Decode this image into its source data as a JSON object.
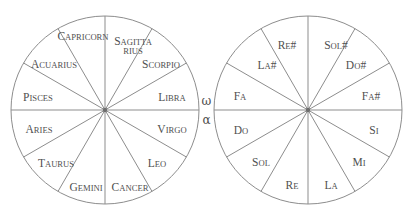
{
  "figure": {
    "background_color": "#ffffff",
    "line_color": "#8d8d8d",
    "text_color": "#4f4f4f",
    "sector_count": 12,
    "sector_degrees": 30
  },
  "connector": {
    "omega": "ω",
    "alpha": "α",
    "omega_name": "omega-symbol",
    "alpha_name": "alpha-symbol"
  },
  "zodiac_wheel": {
    "name": "zodiac-wheel",
    "center_x": 105,
    "center_y": 110,
    "radius": 94,
    "sectors": [
      {
        "id": "sagittarius",
        "line1": "S",
        "line1_rest": "AGITTA",
        "line2": "RIUS",
        "angle": 75,
        "label_x": 133,
        "label_y": 44,
        "two_line": true
      },
      {
        "id": "capricorn",
        "line1": "C",
        "line1_rest": "APRICORN",
        "line2": "",
        "angle": 105,
        "label_x": 83,
        "label_y": 35,
        "two_line": false
      },
      {
        "id": "acuarius",
        "line1": "A",
        "line1_rest": "CUARIUS",
        "line2": "",
        "angle": 135,
        "label_x": 54,
        "label_y": 63,
        "two_line": false
      },
      {
        "id": "pisces",
        "line1": "P",
        "line1_rest": "ISCES",
        "line2": "",
        "angle": 165,
        "label_x": 38,
        "label_y": 96,
        "two_line": false
      },
      {
        "id": "aries",
        "line1": "A",
        "line1_rest": "RIES",
        "line2": "",
        "angle": 195,
        "label_x": 39,
        "label_y": 128,
        "two_line": false
      },
      {
        "id": "taurus",
        "line1": "T",
        "line1_rest": "AURUS",
        "line2": "",
        "angle": 225,
        "label_x": 56,
        "label_y": 162,
        "two_line": false
      },
      {
        "id": "gemini",
        "line1": "G",
        "line1_rest": "EMINI",
        "line2": "",
        "angle": 255,
        "label_x": 86,
        "label_y": 186,
        "two_line": false
      },
      {
        "id": "cancer",
        "line1": "C",
        "line1_rest": "ANCER",
        "line2": "",
        "angle": 285,
        "label_x": 130,
        "label_y": 186,
        "two_line": false
      },
      {
        "id": "leo",
        "line1": "L",
        "line1_rest": "EO",
        "line2": "",
        "angle": 315,
        "label_x": 157,
        "label_y": 162,
        "two_line": false
      },
      {
        "id": "virgo",
        "line1": "V",
        "line1_rest": "IRGO",
        "line2": "",
        "angle": 345,
        "label_x": 172,
        "label_y": 128,
        "two_line": false
      },
      {
        "id": "libra",
        "line1": "L",
        "line1_rest": "IBRA",
        "line2": "",
        "angle": 15,
        "label_x": 172,
        "label_y": 96,
        "two_line": false
      },
      {
        "id": "scorpio",
        "line1": "S",
        "line1_rest": "CORPIO",
        "line2": "",
        "angle": 45,
        "label_x": 161,
        "label_y": 63,
        "two_line": false
      }
    ]
  },
  "solfege_wheel": {
    "name": "solfege-wheel",
    "center_x": 308,
    "center_y": 110,
    "radius": 94,
    "sectors": [
      {
        "id": "sol-sharp",
        "line1": "S",
        "line1_rest": "OL",
        "sharp": "#",
        "angle": 75,
        "label_x": 336,
        "label_y": 44
      },
      {
        "id": "re-sharp",
        "line1": "R",
        "line1_rest": "E",
        "sharp": "#",
        "angle": 105,
        "label_x": 287,
        "label_y": 44
      },
      {
        "id": "la-sharp",
        "line1": "L",
        "line1_rest": "A",
        "sharp": "#",
        "angle": 135,
        "label_x": 267,
        "label_y": 64
      },
      {
        "id": "fa",
        "line1": "F",
        "line1_rest": "A",
        "sharp": "",
        "angle": 165,
        "label_x": 240,
        "label_y": 95
      },
      {
        "id": "do",
        "line1": "D",
        "line1_rest": "O",
        "sharp": "",
        "angle": 195,
        "label_x": 241,
        "label_y": 129
      },
      {
        "id": "sol",
        "line1": "S",
        "line1_rest": "OL",
        "sharp": "",
        "angle": 225,
        "label_x": 261,
        "label_y": 161
      },
      {
        "id": "re",
        "line1": "R",
        "line1_rest": "E",
        "sharp": "",
        "angle": 255,
        "label_x": 292,
        "label_y": 184
      },
      {
        "id": "la",
        "line1": "L",
        "line1_rest": "A",
        "sharp": "",
        "angle": 285,
        "label_x": 331,
        "label_y": 184
      },
      {
        "id": "mi",
        "line1": "M",
        "line1_rest": "I",
        "sharp": "",
        "angle": 315,
        "label_x": 359,
        "label_y": 161
      },
      {
        "id": "si",
        "line1": "S",
        "line1_rest": "I",
        "sharp": "",
        "angle": 345,
        "label_x": 374,
        "label_y": 129
      },
      {
        "id": "fa-sharp",
        "line1": "F",
        "line1_rest": "A",
        "sharp": "#",
        "angle": 15,
        "label_x": 371,
        "label_y": 95
      },
      {
        "id": "do-sharp",
        "line1": "D",
        "line1_rest": "O",
        "sharp": "#",
        "angle": 45,
        "label_x": 356,
        "label_y": 64
      }
    ]
  }
}
